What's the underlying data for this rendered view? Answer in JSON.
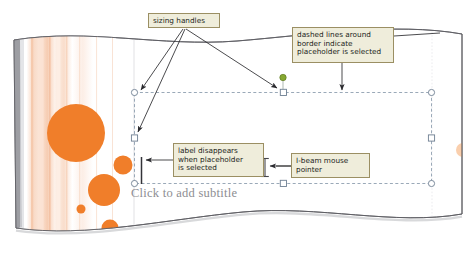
{
  "figure": {
    "kind": "annotated-screenshot"
  },
  "slide": {
    "subtitle_placeholder": {
      "prompt_text": "Click to add subtitle",
      "selected": true,
      "border_style": "dashed"
    },
    "design_theme": {
      "accent_color": "#f07e2a",
      "stripe_color": "#f7cdb4",
      "background_color": "#ffffff",
      "circle_count": 6
    }
  },
  "callouts": [
    {
      "id": "sizing-handles",
      "lines": [
        "sizing handles"
      ],
      "points_to": [
        "placeholder-handle-top-left",
        "placeholder-handle-top-center",
        "placeholder-handle-mid-left"
      ]
    },
    {
      "id": "dashed-border",
      "lines": [
        "dashed lines around",
        "border indicate",
        "placeholder is selected"
      ],
      "points_to": [
        "placeholder-dashed-border"
      ]
    },
    {
      "id": "label-disappears",
      "lines": [
        "label disappears",
        "when placeholder",
        "is selected"
      ],
      "points_to": [
        "text-insertion-bar"
      ]
    },
    {
      "id": "i-beam-pointer",
      "lines": [
        "I-beam mouse",
        "pointer"
      ],
      "points_to": [
        "i-beam-cursor"
      ]
    }
  ],
  "handles": {
    "rotation_handle_color": "#86a831",
    "corner_shape": "circle",
    "edge_shape": "square",
    "outline_color": "#6e7f92"
  },
  "colors": {
    "callout_fill": "#efeddb",
    "callout_border": "#9b8f63",
    "callout_text": "#231f1c",
    "accent_orange": "#f07e2a",
    "prompt_text": "#8d8d92",
    "page_edge": "#5d5d63"
  }
}
